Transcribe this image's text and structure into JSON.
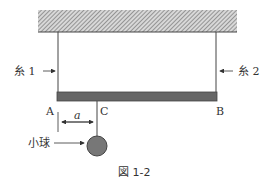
{
  "figure": {
    "caption": "図 1-2",
    "labels": {
      "string1": "糸 1",
      "string2": "糸 2",
      "point_a": "A",
      "point_b": "B",
      "point_c": "C",
      "distance": "a",
      "ball": "小球"
    },
    "colors": {
      "ceiling_hatch": "#999999",
      "bar": "#666666",
      "ball": "#777777",
      "line": "#444444"
    }
  }
}
